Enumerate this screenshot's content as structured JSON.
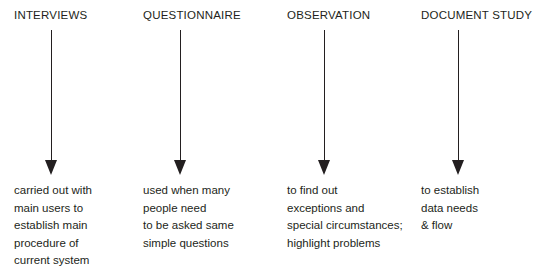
{
  "diagram": {
    "type": "four-column-arrow-diagram",
    "background_color": "#ffffff",
    "text_color": "#231f20",
    "columns": [
      {
        "title": "INTERVIEWS",
        "x": 14,
        "arrow": "down-arrow",
        "lines": [
          "carried out with",
          "main users to",
          "establish main",
          "procedure of",
          "current system"
        ]
      },
      {
        "title": "QUESTIONNAIRE",
        "x": 143,
        "arrow": "down-arrow",
        "lines": [
          "used when many",
          "people need",
          "to be asked same",
          "simple questions"
        ]
      },
      {
        "title": "OBSERVATION",
        "x": 287,
        "arrow": "down-arrow",
        "lines": [
          "to find out",
          "exceptions and",
          "special circumstances;",
          "highlight problems"
        ]
      },
      {
        "title": "DOCUMENT STUDY",
        "x": 421,
        "arrow": "down-arrow",
        "lines": [
          "to establish",
          "data needs",
          "& flow"
        ]
      }
    ]
  }
}
